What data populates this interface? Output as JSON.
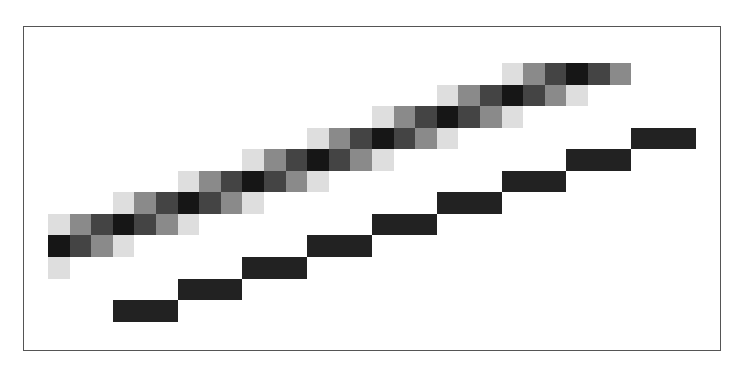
{
  "diagram": {
    "grid": {
      "origin_x": 48,
      "origin_y": 63,
      "cell_w": 21.6,
      "cell_h": 21.55
    },
    "shades": {
      "L": "#dedede",
      "M": "#8a8a8a",
      "D": "#444444",
      "K": "#161616"
    },
    "bar_color": "#222222",
    "frame_color": "#555555",
    "antialiased_line": [
      {
        "row": 0,
        "start_col": 21,
        "pattern": "LMDKDM"
      },
      {
        "row": 1,
        "start_col": 18,
        "pattern": "LMDKDML"
      },
      {
        "row": 2,
        "start_col": 15,
        "pattern": "LMDKDML"
      },
      {
        "row": 3,
        "start_col": 12,
        "pattern": "LMDKDML"
      },
      {
        "row": 4,
        "start_col": 9,
        "pattern": "LMDKDML"
      },
      {
        "row": 5,
        "start_col": 6,
        "pattern": "LMDKDML"
      },
      {
        "row": 6,
        "start_col": 3,
        "pattern": "LMDKDML"
      },
      {
        "row": 7,
        "start_col": 0,
        "pattern": "LMDKDML"
      },
      {
        "row": 8,
        "start_col": 0,
        "pattern": "KDML"
      },
      {
        "row": 9,
        "start_col": 0,
        "pattern": "L"
      }
    ],
    "aliased_line": [
      {
        "row": 11,
        "start_col": 3,
        "length": 3
      },
      {
        "row": 10,
        "start_col": 6,
        "length": 3
      },
      {
        "row": 9,
        "start_col": 9,
        "length": 3
      },
      {
        "row": 8,
        "start_col": 12,
        "length": 3
      },
      {
        "row": 7,
        "start_col": 15,
        "length": 3
      },
      {
        "row": 6,
        "start_col": 18,
        "length": 3
      },
      {
        "row": 5,
        "start_col": 21,
        "length": 3
      },
      {
        "row": 4,
        "start_col": 24,
        "length": 3
      },
      {
        "row": 3,
        "start_col": 27,
        "length": 3
      }
    ]
  }
}
